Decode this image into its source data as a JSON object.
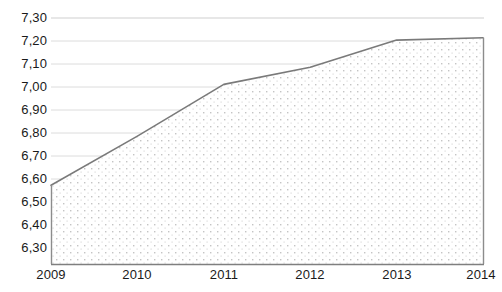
{
  "chart_data": {
    "type": "area",
    "title": "",
    "subtitle": "",
    "xlabel": "",
    "ylabel": "",
    "categories": [
      "2009",
      "2010",
      "2011",
      "2012",
      "2013",
      "2014"
    ],
    "x": [
      2009,
      2010,
      2011,
      2012,
      2013,
      2014
    ],
    "values": [
      6.62,
      6.82,
      7.03,
      7.1,
      7.21,
      7.22
    ],
    "series": [
      {
        "name": "",
        "values": [
          6.62,
          6.82,
          7.03,
          7.1,
          7.21,
          7.22
        ]
      }
    ],
    "ylim": [
      6.3,
      7.3
    ],
    "xlim": [
      2009,
      2014
    ],
    "ytick_labels": [
      "7,30",
      "7,20",
      "7,10",
      "7,00",
      "6,90",
      "6,80",
      "6,70",
      "6,60",
      "6,50",
      "6,40",
      "6,30"
    ],
    "ytick_values": [
      7.3,
      7.2,
      7.1,
      7.0,
      6.9,
      6.8,
      6.7,
      6.6,
      6.5,
      6.4,
      6.3
    ],
    "xtick_labels": [
      "2009",
      "2010",
      "2011",
      "2012",
      "2013",
      "2014"
    ],
    "grid": "horizontal",
    "legend": "none",
    "decimal_separator": ",",
    "colors": {
      "line": "#808080",
      "fill": "#fdfdfd",
      "fill_dots": "#c9c9c9",
      "gridline": "#d9d9d9",
      "axis": "#808080",
      "text": "#1a1a1a",
      "background": "#ffffff"
    },
    "annotations": []
  }
}
